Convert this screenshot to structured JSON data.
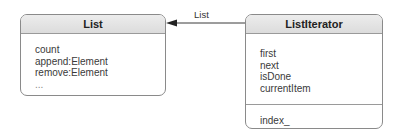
{
  "diagram": {
    "type": "uml-class",
    "classes": [
      {
        "name": "List",
        "operations": [
          "count",
          "append:Element",
          "remove:Element",
          "..."
        ]
      },
      {
        "name": "ListIterator",
        "operations": [
          "first",
          "next",
          "isDone",
          "currentItem"
        ],
        "attributes": [
          "index_"
        ]
      }
    ],
    "association": {
      "from": "ListIterator",
      "to": "List",
      "label": "List",
      "arrow": "navigable-to-List"
    },
    "colors": {
      "border": "#8a8a8a",
      "header_fill": "#e2e2e2",
      "text": "#333333",
      "line": "#333333"
    }
  }
}
